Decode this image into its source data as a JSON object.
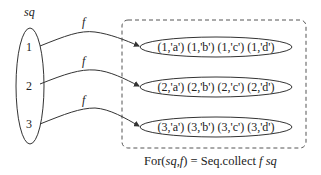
{
  "diagram": {
    "source_set": {
      "label": "sq",
      "elements": [
        "1",
        "2",
        "3"
      ]
    },
    "function_label": "f",
    "arrows": [
      {
        "from": "1",
        "label": "f",
        "to": "row_1"
      },
      {
        "from": "2",
        "label": "f",
        "to": "row_2"
      },
      {
        "from": "3",
        "label": "f",
        "to": "row_3"
      }
    ],
    "result_rows": [
      {
        "id": "row_1",
        "text": "(1,'a') (1,'b') (1,'c') (1,'d')"
      },
      {
        "id": "row_2",
        "text": "(2,'a') (2,'b') (2,'c') (2,'d')"
      },
      {
        "id": "row_3",
        "text": "(3,'a') (3,'b') (3,'c') (3,'d')"
      }
    ],
    "caption": {
      "prefix": "For(",
      "arg1": "sq",
      "sep": ",",
      "arg2": "f",
      "mid": ") = Seq.collect ",
      "fn": "f",
      "space": " ",
      "arg3": "sq"
    },
    "colors": {
      "stroke": "#333333",
      "text": "#222222",
      "background": "#ffffff"
    }
  }
}
